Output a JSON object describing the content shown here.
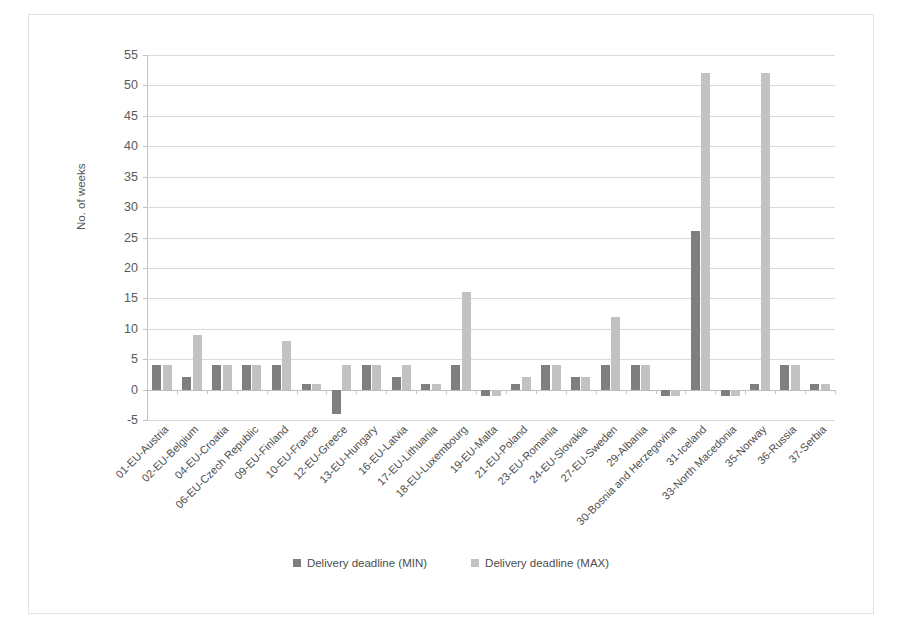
{
  "chart_data": {
    "type": "bar",
    "title": "",
    "xlabel": "",
    "ylabel": "No. of weeks",
    "ylim": [
      -5,
      55
    ],
    "yticks": [
      -5,
      0,
      5,
      10,
      15,
      20,
      25,
      30,
      35,
      40,
      45,
      50,
      55
    ],
    "grid": true,
    "legend_position": "bottom",
    "colors": {
      "min": "#7f7f7f",
      "max": "#c2c2c2"
    },
    "categories": [
      "01-EU-Austria",
      "02-EU-Belgium",
      "04-EU-Croatia",
      "06-EU-Czech Republic",
      "09-EU-Finland",
      "10-EU-France",
      "12-EU-Greece",
      "13-EU-Hungary",
      "16-EU-Latvia",
      "17-EU-Lithuania",
      "18-EU-Luxembourg",
      "19-EU-Malta",
      "21-EU-Poland",
      "23-EU-Romania",
      "24-EU-Slovakia",
      "27-EU-Sweden",
      "29-Albania",
      "30-Bosnia and Herzegovina",
      "31-Iceland",
      "33-North Macedonia",
      "35-Norway",
      "36-Russia",
      "37-Serbia"
    ],
    "series": [
      {
        "name": "Delivery deadline (MIN)",
        "color": "#7f7f7f",
        "values": [
          4,
          2,
          4,
          4,
          4,
          1,
          -4,
          4,
          2,
          1,
          4,
          -1,
          1,
          4,
          2,
          4,
          4,
          -1,
          26,
          -1,
          1,
          4,
          1
        ]
      },
      {
        "name": "Delivery deadline (MAX)",
        "color": "#c2c2c2",
        "values": [
          4,
          9,
          4,
          4,
          8,
          1,
          4,
          4,
          4,
          1,
          16,
          -1,
          2,
          4,
          2,
          12,
          4,
          -1,
          52,
          -1,
          52,
          4,
          1
        ]
      }
    ]
  },
  "legend": {
    "items": [
      {
        "label": "Delivery deadline (MIN)",
        "color": "#7f7f7f"
      },
      {
        "label": "Delivery deadline (MAX)",
        "color": "#c2c2c2"
      }
    ]
  }
}
